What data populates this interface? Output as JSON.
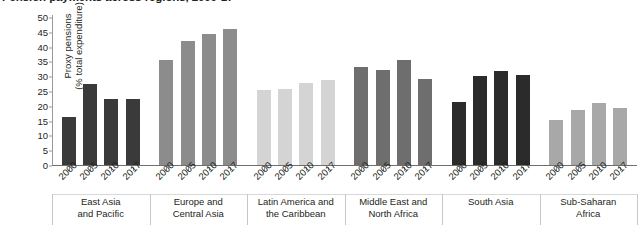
{
  "chart_data": {
    "type": "bar",
    "title": "Pension payments across regions, 2000-17",
    "xlabel": "",
    "ylabel": "Proxy pensions (% total expenditure)",
    "ylabel_line1": "Proxy pensions",
    "ylabel_line2": "(% total expenditure)",
    "ylim": [
      0,
      50
    ],
    "ytick_step": 5,
    "yticks": [
      0,
      5,
      10,
      15,
      20,
      25,
      30,
      35,
      40,
      45,
      50
    ],
    "grid": false,
    "legend": "none",
    "categories": [
      "2000",
      "2005",
      "2010",
      "2017"
    ],
    "groups": [
      {
        "name": "East Asia and Pacific",
        "name_line1": "East Asia",
        "name_line2": "and Pacific",
        "color": "#3a3a3a",
        "values": [
          16.1,
          27.3,
          22.2,
          22.2
        ]
      },
      {
        "name": "Europe and Central Asia",
        "name_line1": "Europe and",
        "name_line2": "Central Asia",
        "color": "#8c8c8c",
        "values": [
          35.4,
          41.9,
          44.1,
          46.1
        ]
      },
      {
        "name": "Latin America and the Caribbean",
        "name_line1": "Latin America and",
        "name_line2": "the Caribbean",
        "color": "#d4d4d4",
        "values": [
          25.4,
          25.7,
          27.8,
          28.7
        ]
      },
      {
        "name": "Middle East and North Africa",
        "name_line1": "Middle East and",
        "name_line2": "North Africa",
        "color": "#6e6e6e",
        "values": [
          33.0,
          32.0,
          35.4,
          29.2
        ]
      },
      {
        "name": "South Asia",
        "name_line1": "South Asia",
        "name_line2": "",
        "color": "#2b2b2b",
        "values": [
          21.3,
          30.2,
          31.6,
          30.3
        ]
      },
      {
        "name": "Sub-Saharan Africa",
        "name_line1": "Sub-Saharan",
        "name_line2": "Africa",
        "color": "#a8a8a8",
        "values": [
          15.1,
          18.7,
          20.9,
          19.2
        ]
      }
    ]
  }
}
